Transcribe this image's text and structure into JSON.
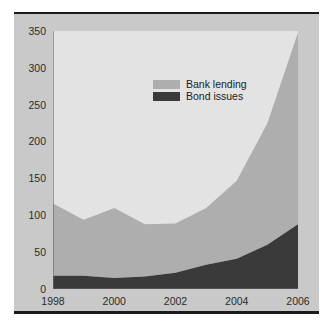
{
  "chart_data": {
    "type": "area",
    "stacked": true,
    "title": "",
    "subtitle": "",
    "xlabel": "",
    "ylabel": "",
    "x": [
      1998,
      1999,
      2000,
      2001,
      2002,
      2003,
      2004,
      2005,
      2006
    ],
    "categories": [
      "1998",
      "1999",
      "2000",
      "2001",
      "2002",
      "2003",
      "2004",
      "2005",
      "2006"
    ],
    "series": [
      {
        "name": "Bond issues",
        "color": "#3a3a3a",
        "values": [
          18,
          18,
          15,
          17,
          22,
          33,
          41,
          60,
          88
        ]
      },
      {
        "name": "Bank lending",
        "color": "#aeaeae",
        "values": [
          98,
          76,
          95,
          71,
          67,
          77,
          106,
          165,
          260
        ]
      }
    ],
    "totals": [
      116,
      94,
      110,
      88,
      89,
      110,
      147,
      225,
      348
    ],
    "ylim": [
      0,
      350
    ],
    "xlim": [
      1998,
      2006
    ],
    "yticks": [
      0,
      50,
      100,
      150,
      200,
      250,
      300,
      350
    ],
    "ytick_labels": [
      "0",
      "50",
      "100",
      "150",
      "200",
      "250",
      "300",
      "350"
    ],
    "xticks": [
      1998,
      2000,
      2002,
      2004,
      2006
    ],
    "xtick_labels": [
      "1998",
      "2000",
      "2002",
      "2004",
      "2006"
    ],
    "grid": false,
    "legend_position": "upper-center",
    "legend": [
      {
        "label": "Bank lending",
        "color": "#aeaeae"
      },
      {
        "label": "Bond issues",
        "color": "#3a3a3a"
      }
    ],
    "plot_background": "#e3e3e3",
    "figure_background": "#c9c9c9"
  }
}
